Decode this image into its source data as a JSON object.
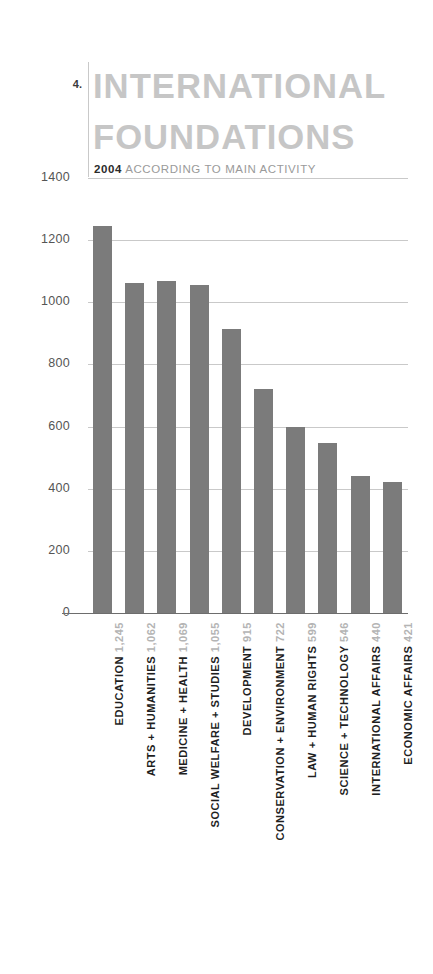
{
  "header": {
    "figure_number": "4.",
    "title_line1": "INTERNATIONAL",
    "title_line2": "FOUNDATIONS",
    "subtitle_year": "2004",
    "subtitle_text": "ACCORDING TO MAIN ACTIVITY"
  },
  "colors": {
    "bar": "#7b7b7b",
    "title": "#c6c6c6",
    "gridline": "#c9c9c9",
    "value_label": "#b4b4b4",
    "category_label": "#1f1f1f",
    "axis": "#6d6d6d"
  },
  "chart_data": {
    "type": "bar",
    "title": "INTERNATIONAL FOUNDATIONS",
    "subtitle": "2004 ACCORDING TO MAIN ACTIVITY",
    "xlabel": "",
    "ylabel": "",
    "ylim": [
      0,
      1400
    ],
    "grid": true,
    "legend": "none",
    "orientation": "vertical",
    "ytick_labels": [
      "1400",
      "1200",
      "1000",
      "800",
      "600",
      "400",
      "200",
      "0"
    ],
    "ytick_values": [
      1400,
      1200,
      1000,
      800,
      600,
      400,
      200,
      0
    ],
    "categories": [
      "EDUCATION",
      "ARTS + HUMANITIES",
      "MEDICINE + HEALTH",
      "SOCIAL WELFARE + STUDIES",
      "DEVELOPMENT",
      "CONSERVATION + ENVIRONMENT",
      "LAW + HUMAN RIGHTS",
      "SCIENCE + TECHNOLOGY",
      "INTERNATIONAL AFFAIRS",
      "ECONOMIC AFFAIRS"
    ],
    "values": [
      1245,
      1062,
      1069,
      1055,
      915,
      722,
      599,
      546,
      440,
      421
    ],
    "value_labels": [
      "1,245",
      "1,062",
      "1,069",
      "1,055",
      "915",
      "722",
      "599",
      "546",
      "440",
      "421"
    ]
  }
}
